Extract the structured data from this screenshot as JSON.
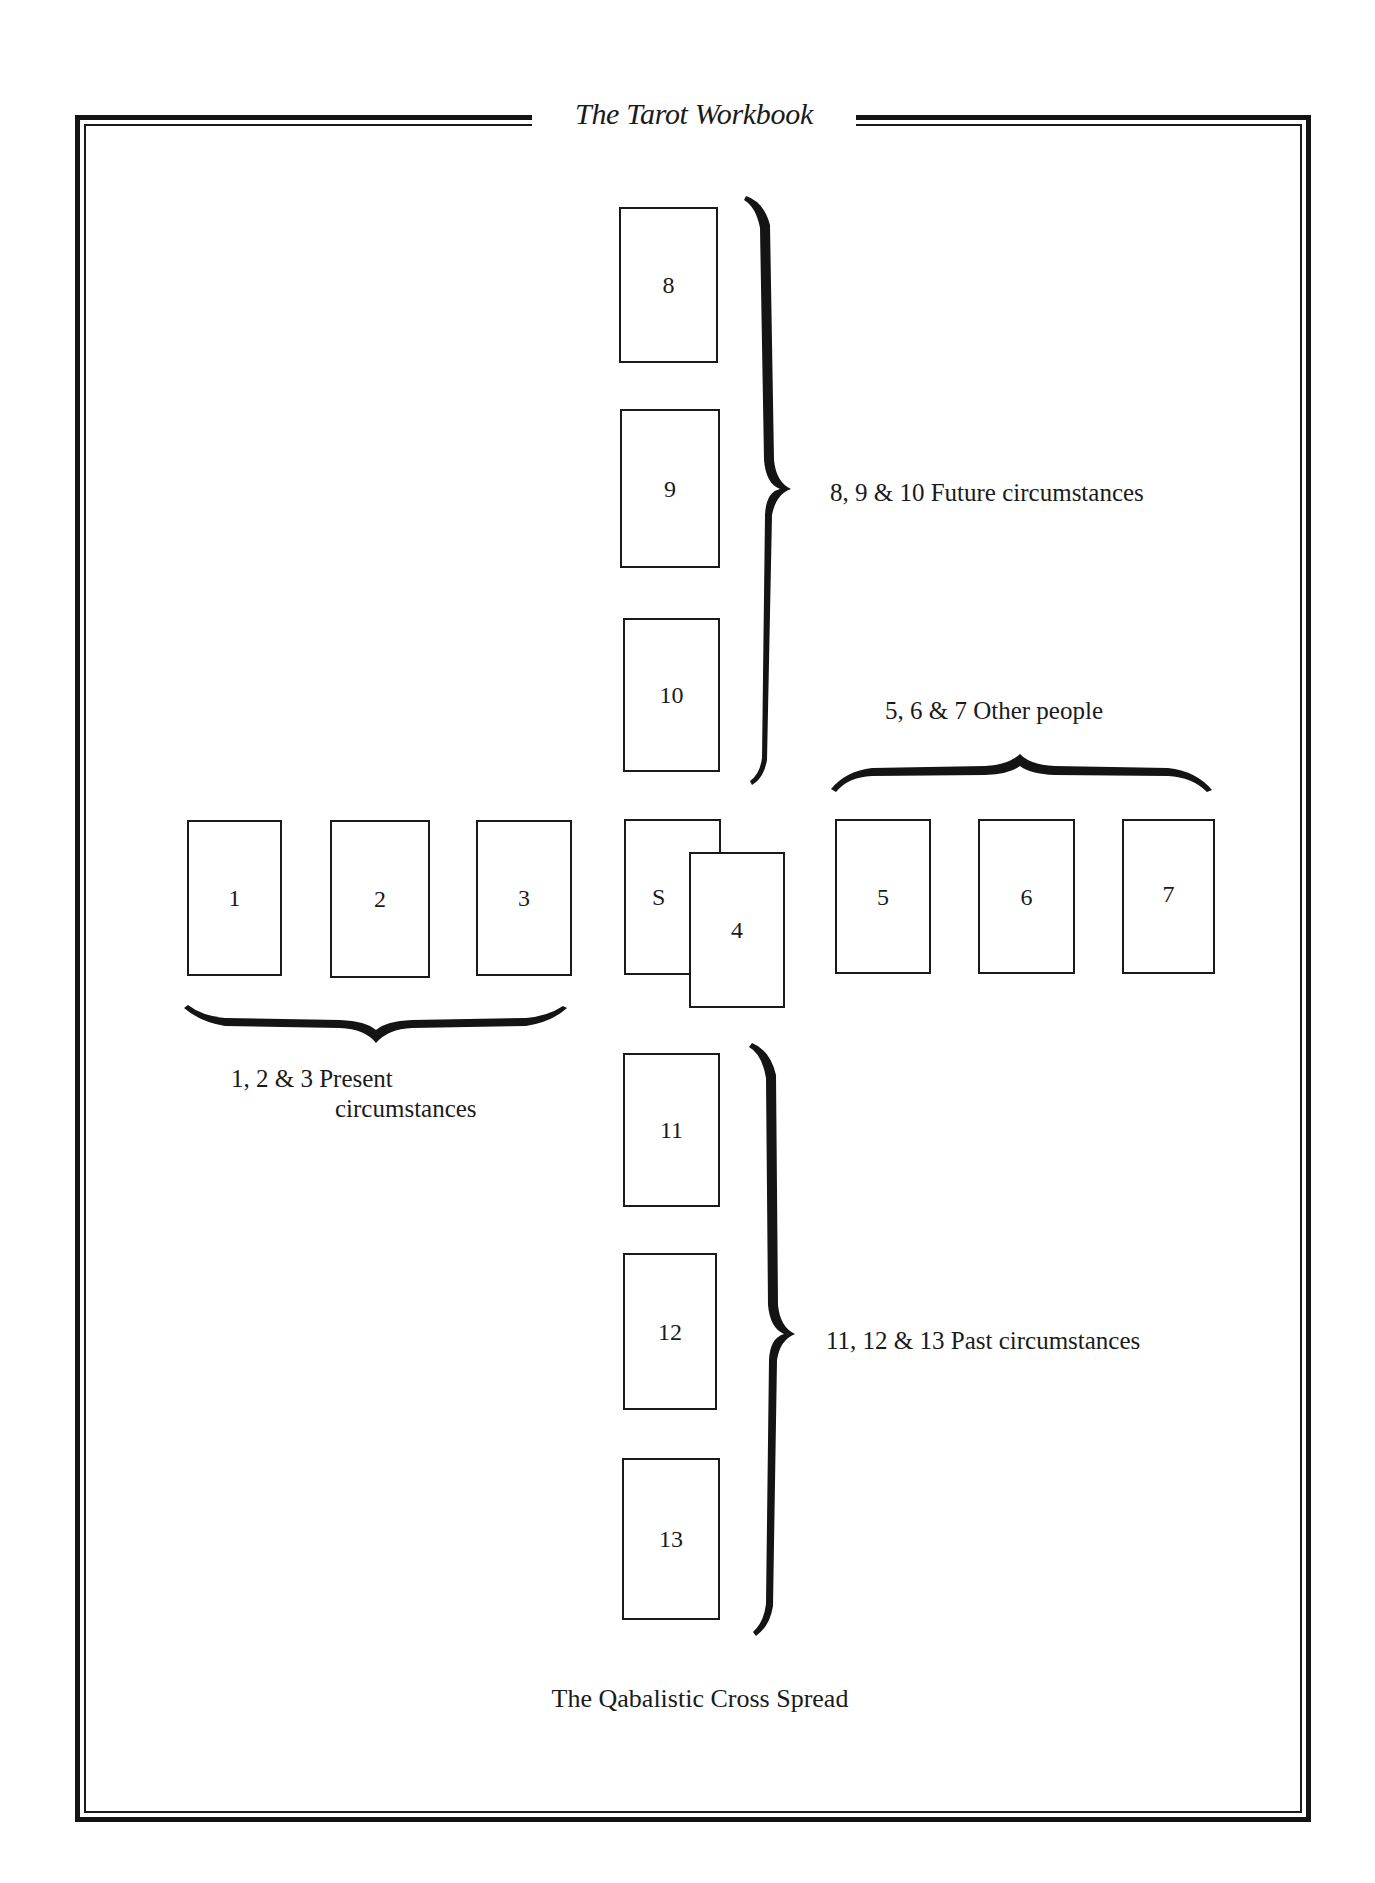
{
  "header": {
    "title": "The Tarot Workbook"
  },
  "spread": {
    "caption": "The Qabalistic Cross Spread",
    "cards": [
      {
        "label": "8",
        "x": 619,
        "y": 207,
        "w": 99,
        "h": 156
      },
      {
        "label": "9",
        "x": 620,
        "y": 409,
        "w": 100,
        "h": 159
      },
      {
        "label": "10",
        "x": 623,
        "y": 618,
        "w": 97,
        "h": 154
      },
      {
        "label": "1",
        "x": 187,
        "y": 820,
        "w": 95,
        "h": 156
      },
      {
        "label": "2",
        "x": 330,
        "y": 820,
        "w": 100,
        "h": 158
      },
      {
        "label": "3",
        "x": 476,
        "y": 820,
        "w": 96,
        "h": 156
      },
      {
        "label": "S",
        "x": 624,
        "y": 819,
        "w": 97,
        "h": 156
      },
      {
        "label": "4",
        "x": 689,
        "y": 852,
        "w": 96,
        "h": 156
      },
      {
        "label": "5",
        "x": 835,
        "y": 819,
        "w": 96,
        "h": 155
      },
      {
        "label": "6",
        "x": 978,
        "y": 819,
        "w": 97,
        "h": 155
      },
      {
        "label": "7",
        "x": 1122,
        "y": 819,
        "w": 93,
        "h": 155
      },
      {
        "label": "11",
        "x": 623,
        "y": 1053,
        "w": 97,
        "h": 154
      },
      {
        "label": "12",
        "x": 623,
        "y": 1253,
        "w": 94,
        "h": 157
      },
      {
        "label": "13",
        "x": 622,
        "y": 1458,
        "w": 98,
        "h": 162
      }
    ],
    "groups": {
      "future": "8, 9 & 10 Future circumstances",
      "other_people": "5, 6 & 7 Other people",
      "present_line1": "1, 2 & 3 Present",
      "present_line2": "circumstances",
      "past": "11, 12 & 13 Past circumstances"
    }
  },
  "icons": {
    "right_brace": "curly-brace-right",
    "top_brace": "curly-brace-over",
    "bottom_brace": "curly-brace-under"
  },
  "colors": {
    "ink": "#1a1a1a",
    "paper": "#ffffff"
  }
}
